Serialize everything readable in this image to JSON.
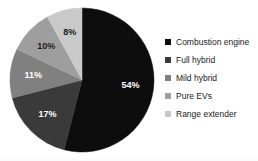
{
  "chart_data": {
    "type": "pie",
    "title": "",
    "subtitle": "",
    "xlabel": "",
    "ylabel": "",
    "grid": false,
    "legend_position": "right",
    "start_angle_deg": 0,
    "direction": "clockwise",
    "categories": [
      "Combustion engine",
      "Full hybrid",
      "Mild hybrid",
      "Pure EVs",
      "Range extender"
    ],
    "values": [
      54,
      17,
      11,
      10,
      8
    ],
    "data_labels": [
      "54%",
      "17%",
      "11%",
      "10%",
      "8%"
    ],
    "colors": [
      "#0d0d0d",
      "#3a3a3a",
      "#808080",
      "#9e9e9e",
      "#c9c9c9"
    ],
    "label_text_colors": [
      "#ffffff",
      "#ffffff",
      "#ffffff",
      "#1a1a1a",
      "#1a1a1a"
    ],
    "slices": [
      {
        "label": "Combustion engine",
        "value": 54,
        "data_label": "54%",
        "color": "#0d0d0d"
      },
      {
        "label": "Full hybrid",
        "value": 17,
        "data_label": "17%",
        "color": "#3a3a3a"
      },
      {
        "label": "Mild hybrid",
        "value": 11,
        "data_label": "11%",
        "color": "#808080"
      },
      {
        "label": "Pure EVs",
        "value": 10,
        "data_label": "10%",
        "color": "#9e9e9e"
      },
      {
        "label": "Range extender",
        "value": 8,
        "data_label": "8%",
        "color": "#c9c9c9"
      }
    ],
    "geometry": {
      "center_x": 82,
      "center_y": 80,
      "radius": 72
    }
  },
  "legend": {
    "items": [
      {
        "label": "Combustion engine",
        "color": "#0d0d0d"
      },
      {
        "label": "Full hybrid",
        "color": "#3a3a3a"
      },
      {
        "label": "Mild hybrid",
        "color": "#808080"
      },
      {
        "label": "Pure EVs",
        "color": "#9e9e9e"
      },
      {
        "label": "Range extender",
        "color": "#c9c9c9"
      }
    ]
  },
  "background": "#ffffff"
}
